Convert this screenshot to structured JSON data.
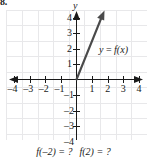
{
  "figure": {
    "problem_number": "8.",
    "background_color": "#ffffff",
    "ink_color": "#1a1a1a",
    "grid_color": "#e8e8ea"
  },
  "chart_data": {
    "type": "line",
    "title": "",
    "subtitle": "",
    "xlabel": "",
    "ylabel": "y",
    "grid": true,
    "legend_position": "inside-right",
    "xlim": [
      -4.6,
      4.6
    ],
    "ylim": [
      -4.6,
      5.2
    ],
    "x_ticks": [
      -4,
      -3,
      -2,
      -1,
      1,
      2,
      3,
      4
    ],
    "x_tick_labels": [
      "–4",
      "–3",
      "–2",
      "–1",
      "1",
      "2",
      "3",
      "4"
    ],
    "y_ticks": [
      4,
      3,
      2,
      1,
      -1,
      -2,
      -3,
      -4
    ],
    "y_tick_labels": [
      "4",
      "3",
      "2",
      "1",
      "–1",
      "–2",
      "–3",
      "–4"
    ],
    "axis_arrows": [
      "left",
      "right",
      "up"
    ],
    "series": [
      {
        "name": "y = f(x)",
        "type": "ray",
        "style": "solid",
        "arrow_end": true,
        "points": [
          [
            0,
            0
          ],
          [
            2.1,
            4.9
          ]
        ],
        "slope": 2.33,
        "description": "ray from origin up and to the right"
      }
    ],
    "annotations": [
      {
        "text": "y = f(x)",
        "x": 2.2,
        "y": 2.2,
        "italic": true
      }
    ]
  },
  "function_label": {
    "y": "y",
    "equals": "=",
    "fx": "f(x)",
    "full": "y = f(x)"
  },
  "caption": {
    "question_1": "f(–2) = ?",
    "question_2": "f(2) = ?",
    "full": "f(–2) = ?  f(2) = ?"
  }
}
